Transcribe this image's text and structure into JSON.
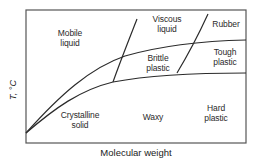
{
  "diagram": {
    "type": "phase-diagram",
    "x_axis_label": "Molecular weight",
    "y_axis_label": "T, °C",
    "colors": {
      "line": "#2b2b2b",
      "frame": "#555555",
      "background": "#ffffff"
    },
    "regions": [
      {
        "id": "mobile-liquid",
        "line1": "Mobile",
        "line2": "liquid"
      },
      {
        "id": "viscous-liquid",
        "line1": "Viscous",
        "line2": "liquid"
      },
      {
        "id": "rubber",
        "line1": "Rubber",
        "line2": ""
      },
      {
        "id": "brittle-plastic",
        "line1": "Brittle",
        "line2": "plastic"
      },
      {
        "id": "tough-plastic",
        "line1": "Tough",
        "line2": "plastic"
      },
      {
        "id": "crystalline-solid",
        "line1": "Crystalline",
        "line2": "solid"
      },
      {
        "id": "waxy",
        "line1": "Waxy",
        "line2": ""
      },
      {
        "id": "hard-plastic",
        "line1": "Hard",
        "line2": "plastic"
      }
    ],
    "boundaries": [
      {
        "id": "upper-curve",
        "description": "liquid / plastic boundary"
      },
      {
        "id": "lower-curve",
        "description": "crystalline / plastic boundary"
      },
      {
        "id": "left-steep-line",
        "description": "mobile liquid & crystalline / viscous & brittle"
      },
      {
        "id": "right-steep-line",
        "description": "viscous & brittle / rubber & tough"
      }
    ]
  }
}
